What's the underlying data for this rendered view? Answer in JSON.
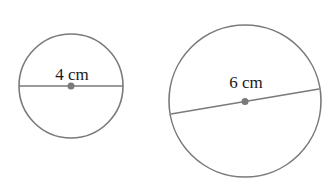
{
  "diagram": {
    "background": "#ffffff",
    "stroke_color": "#7a7a7a",
    "center_dot_color": "#7a7a7a",
    "circles": [
      {
        "name": "small-circle",
        "diameter_label": "4 cm",
        "center": [
          71,
          86
        ],
        "radius": 52,
        "diameter_line": {
          "x1": 19,
          "y1": 86,
          "x2": 123,
          "y2": 86
        },
        "label_pos": [
          72,
          80
        ]
      },
      {
        "name": "large-circle",
        "diameter_label": "6 cm",
        "center": [
          245,
          101
        ],
        "radius": 76,
        "diameter_line": {
          "x1": 171,
          "y1": 114,
          "x2": 319,
          "y2": 89
        },
        "label_pos": [
          246,
          88
        ]
      }
    ]
  }
}
